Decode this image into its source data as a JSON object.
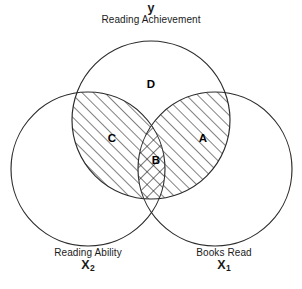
{
  "diagram": {
    "type": "venn-three-circle",
    "stroke_color": "#2b2b2b",
    "fill_color": "#ffffff",
    "hatch_color": "#1a1a1a",
    "circles": [
      {
        "id": "y",
        "name": "Reading Achievement",
        "variable": "y",
        "variable_subscript": "",
        "position": "top",
        "cx": 151,
        "cy": 120,
        "r": 79
      },
      {
        "id": "x2",
        "name": "Reading Ability",
        "variable": "X",
        "variable_subscript": "2",
        "position": "bottom-left",
        "cx": 88,
        "cy": 169,
        "r": 77
      },
      {
        "id": "x1",
        "name": "Books Read",
        "variable": "X",
        "variable_subscript": "1",
        "position": "bottom-right",
        "cx": 215,
        "cy": 169,
        "r": 77
      }
    ],
    "regions": [
      {
        "label": "D",
        "description": "Reading Achievement only",
        "fill": "none",
        "x": 151,
        "y": 84
      },
      {
        "label": "C",
        "description": "Reading Achievement and Reading Ability only",
        "fill": "diagonal-hatch",
        "x": 112,
        "y": 138
      },
      {
        "label": "A",
        "description": "Reading Achievement and Books Read only",
        "fill": "diagonal-hatch",
        "x": 203,
        "y": 138
      },
      {
        "label": "B",
        "description": "All three overlap",
        "fill": "cross-hatch",
        "x": 156,
        "y": 160
      }
    ]
  }
}
